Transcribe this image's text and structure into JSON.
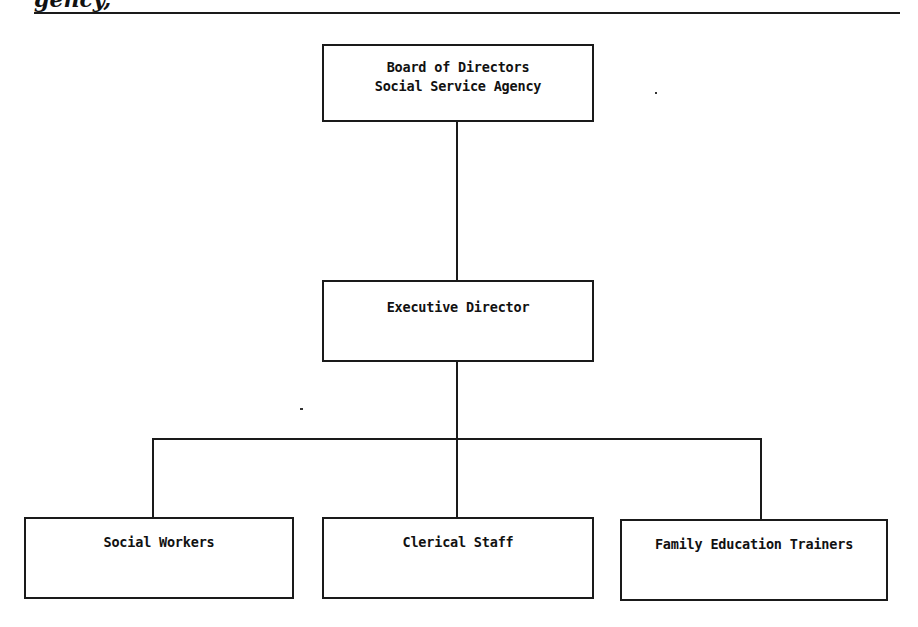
{
  "page": {
    "clipped_heading": "gency,"
  },
  "chart": {
    "title": "",
    "nodes": {
      "board": {
        "line1": "Board of Directors",
        "line2": "Social Service Agency"
      },
      "executive": {
        "label": "Executive Director"
      },
      "children": [
        {
          "label": "Social Workers"
        },
        {
          "label": "Clerical Staff"
        },
        {
          "label": "Family Education Trainers"
        }
      ]
    },
    "edges": [
      [
        "Board of Directors / Social Service Agency",
        "Executive Director"
      ],
      [
        "Executive Director",
        "Social Workers"
      ],
      [
        "Executive Director",
        "Clerical Staff"
      ],
      [
        "Executive Director",
        "Family Education Trainers"
      ]
    ],
    "colors": {
      "stroke": "#1a1a1a",
      "background": "#ffffff",
      "text": "#111111"
    }
  }
}
